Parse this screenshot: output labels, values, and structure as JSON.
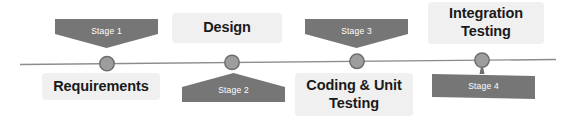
{
  "diagram": {
    "type": "horizontal-timeline",
    "axis": {
      "line_color": "#8c8c8c",
      "marker_fill": "#9a9a9a",
      "marker_stroke": "#6e6e6e",
      "start_x": 20,
      "end_x": 556,
      "y": 62
    },
    "colors": {
      "stage_shape": "#767676",
      "stage_text": "#ffffff",
      "phase_chip_bg": "#f0f0f0",
      "phase_text": "#1a1a1a",
      "background": "#ffffff"
    },
    "milestones": [
      {
        "stage_label": "Stage 1",
        "phase_label": "Requirements",
        "stage_position": "above",
        "phase_position": "below",
        "marker_x": 107
      },
      {
        "stage_label": "Stage 2",
        "phase_label": "Design",
        "stage_position": "below",
        "phase_position": "above",
        "marker_x": 232
      },
      {
        "stage_label": "Stage 3",
        "phase_label": "Coding & Unit Testing",
        "phase_line_1": "Coding & Unit",
        "phase_line_2": "Testing",
        "stage_position": "above",
        "phase_position": "below",
        "marker_x": 357
      },
      {
        "stage_label": "Stage 4",
        "phase_label": "Integration Testing",
        "phase_line_1": "Integration",
        "phase_line_2": "Testing",
        "stage_position": "below",
        "phase_position": "above",
        "marker_x": 482
      }
    ]
  }
}
